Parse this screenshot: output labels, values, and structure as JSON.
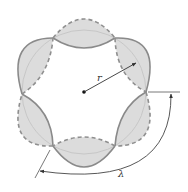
{
  "figure": {
    "labels": {
      "radius": "r",
      "wavelength": "λ"
    },
    "colors": {
      "lobe_fill": "#dcdcdc",
      "solid_line": "#8a8a8a",
      "dashed_line": "#8f8f8f",
      "inner_circle": "#c4c4c4",
      "arrow": "#333333",
      "center_dot": "#111111"
    },
    "lobe_count": 6
  }
}
